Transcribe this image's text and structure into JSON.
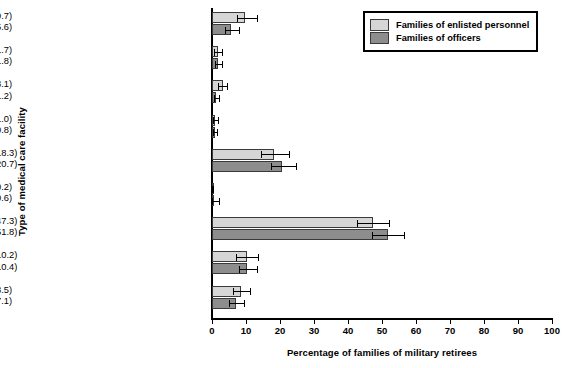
{
  "chart_data": {
    "type": "bar",
    "orientation": "horizontal",
    "title": "",
    "xlabel": "Percentage of families of military retirees",
    "ylabel": "Type of medical care facility",
    "xlim": [
      0,
      100
    ],
    "xticks": [
      0,
      10,
      20,
      30,
      40,
      50,
      60,
      70,
      80,
      90,
      100
    ],
    "grid": false,
    "legend_position": "top-right",
    "categories": [
      "No medical care received",
      "All three facility types",
      "Civilian and other facility",
      "Military and other facility",
      "Military and civilian facility",
      "Other facility (VA clinic,\nUSFHP clinic)",
      "Civilian facility only",
      "Military facility only",
      "No spouse/dependents"
    ],
    "series": [
      {
        "name": "Families of enlisted personnel",
        "color": "#d6d6d6",
        "values": [
          9.7,
          1.7,
          3.1,
          1.0,
          18.3,
          0.2,
          47.3,
          10.2,
          8.5
        ],
        "err_low": [
          2.3,
          1.0,
          1.3,
          0.6,
          3.9,
          0.15,
          4.8,
          3.0,
          2.3
        ],
        "err_high": [
          3.4,
          1.1,
          1.4,
          0.7,
          4.4,
          0.2,
          4.9,
          3.3,
          2.6
        ]
      },
      {
        "name": "Families of officers",
        "color": "#8d8d8d",
        "values": [
          5.6,
          1.8,
          1.2,
          0.8,
          20.7,
          0.6,
          51.8,
          10.4,
          7.1
        ],
        "err_low": [
          1.8,
          1.0,
          0.7,
          0.5,
          3.4,
          0.5,
          4.7,
          2.6,
          2.0
        ],
        "err_high": [
          2.4,
          1.2,
          0.8,
          0.6,
          3.9,
          1.5,
          4.6,
          2.9,
          2.4
        ]
      }
    ],
    "value_labels": [
      [
        "(9.7)",
        "(5.6)"
      ],
      [
        "(1.7)",
        "(1.8)"
      ],
      [
        "(3.1)",
        "(1.2)"
      ],
      [
        "(1.0)",
        "(0.8)"
      ],
      [
        "(18.3)",
        "(20.7)"
      ],
      [
        "(0.2)",
        "(0.6)"
      ],
      [
        "(47.3)",
        "(51.8)"
      ],
      [
        "(10.2)",
        "(10.4)"
      ],
      [
        "(8.5)",
        "(7.1)"
      ]
    ]
  },
  "legend": {
    "items": [
      {
        "label": "Families of enlisted personnel"
      },
      {
        "label": "Families of officers"
      }
    ]
  }
}
